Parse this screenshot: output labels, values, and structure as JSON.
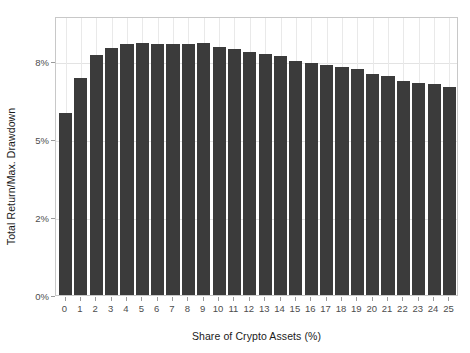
{
  "chart_data": {
    "type": "bar",
    "title": "",
    "xlabel": "Share of Crypto Assets (%)",
    "ylabel": "Total Return/Max. Drawdown",
    "categories": [
      "0",
      "1",
      "2",
      "3",
      "4",
      "5",
      "6",
      "7",
      "8",
      "9",
      "10",
      "11",
      "12",
      "13",
      "14",
      "15",
      "16",
      "17",
      "18",
      "19",
      "20",
      "21",
      "22",
      "23",
      "24",
      "25"
    ],
    "values": [
      7.02,
      8.37,
      9.23,
      9.52,
      9.66,
      9.7,
      9.68,
      9.67,
      9.69,
      9.7,
      9.55,
      9.48,
      9.38,
      9.3,
      9.2,
      9.02,
      8.93,
      8.85,
      8.78,
      8.7,
      8.52,
      8.42,
      8.25,
      8.18,
      8.12,
      8.03
    ],
    "ylim": [
      0,
      10.75
    ],
    "xlim": [
      -0.62,
      25.62
    ],
    "ytick_values": [
      0,
      2,
      5,
      8
    ],
    "ytick_labels": [
      "0%",
      "2%",
      "5%",
      "8%"
    ],
    "ytick_positions_px": [
      296,
      218,
      140,
      62
    ],
    "grid": true,
    "grid_color": "#e3e3e3",
    "legend": "none",
    "bar_color": "#3b3b3b",
    "background": "#ffffff",
    "panel_border_color": "#c8c8c8",
    "axis_text_color": "#4d4d4d",
    "title_text_color": "#1a1a1a"
  }
}
